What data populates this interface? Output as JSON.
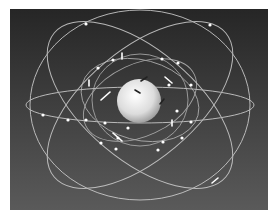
{
  "scene": {
    "subject": "satellite constellation orbits around Earth",
    "background_top": "#262626",
    "background_bottom": "#5a5a5a",
    "orbit_color": "#cfcfcf",
    "earth_color": "#e8e8e8"
  }
}
